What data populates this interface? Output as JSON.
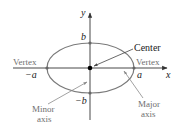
{
  "diagram": {
    "axes": {
      "x_label": "x",
      "y_label": "y"
    },
    "points": {
      "top": "b",
      "bottom": "−b",
      "left": "−a",
      "right": "a"
    },
    "labels": {
      "center": "Center",
      "vertex_left": "Vertex",
      "vertex_right": "Vertex",
      "minor_axis_line1": "Minor",
      "minor_axis_line2": "axis",
      "major_axis_line1": "Major",
      "major_axis_line2": "axis"
    },
    "colors": {
      "ellipse": "#7a7a7a",
      "axes": "#333333",
      "text_dark": "#222222",
      "text_gray": "#6f6f6f",
      "center_dot": "#000000"
    }
  }
}
